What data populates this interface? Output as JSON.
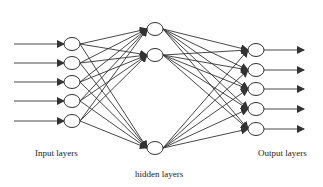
{
  "diagram": {
    "layers": {
      "input": {
        "label": "Input layers",
        "node_count": 5
      },
      "hidden": {
        "label": "hidden layers",
        "node_count": 3
      },
      "output": {
        "label": "Output layers",
        "node_count": 5
      }
    },
    "connections": "fully-connected",
    "colors": {
      "line": "#333333",
      "node_fill": "#ffffff",
      "background": "#ffffff"
    }
  }
}
